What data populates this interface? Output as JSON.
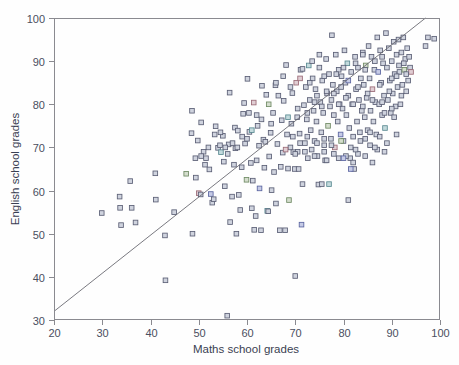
{
  "chart_data": {
    "type": "scatter",
    "title": "",
    "xlabel": "Maths school grades",
    "ylabel": "English school grades",
    "xlim": [
      20,
      100
    ],
    "ylim": [
      30,
      100
    ],
    "xticks": [
      20,
      30,
      40,
      50,
      60,
      70,
      80,
      90,
      100
    ],
    "yticks": [
      30,
      40,
      50,
      60,
      70,
      80,
      90,
      100
    ],
    "grid": false,
    "legend": null,
    "annotations": [
      {
        "type": "reference-line",
        "description": "diagonal identity line",
        "from": [
          20,
          32
        ],
        "to": [
          97,
          100
        ]
      }
    ],
    "marker": {
      "shape": "square",
      "size": 4.6,
      "edge_color": "#5b5f75",
      "face_color": "#cfd3de"
    },
    "points": [
      [
        29.9,
        54.8
      ],
      [
        33.6,
        58.6
      ],
      [
        33.7,
        56.0
      ],
      [
        33.9,
        52.0
      ],
      [
        35.8,
        62.2
      ],
      [
        36.1,
        56.0
      ],
      [
        36.9,
        52.6
      ],
      [
        41.0,
        64.0
      ],
      [
        41.1,
        57.9
      ],
      [
        43.0,
        49.6
      ],
      [
        43.1,
        39.2
      ],
      [
        44.9,
        55.0
      ],
      [
        47.4,
        63.9
      ],
      [
        48.6,
        78.5
      ],
      [
        48.5,
        73.3
      ],
      [
        48.7,
        50.0
      ],
      [
        49.4,
        63.0
      ],
      [
        49.8,
        71.6
      ],
      [
        49.3,
        67.5
      ],
      [
        50.0,
        59.4
      ],
      [
        50.4,
        59.1
      ],
      [
        50.5,
        75.8
      ],
      [
        51.3,
        66.0
      ],
      [
        51.5,
        67.5
      ],
      [
        52.2,
        64.9
      ],
      [
        52.5,
        59.2
      ],
      [
        52.8,
        57.2
      ],
      [
        53.3,
        73.0
      ],
      [
        53.1,
        58.0
      ],
      [
        53.5,
        74.9
      ],
      [
        54.0,
        69.9
      ],
      [
        54.4,
        70.5
      ],
      [
        54.6,
        68.9
      ],
      [
        55.0,
        72.7
      ],
      [
        55.2,
        66.7
      ],
      [
        55.4,
        61.0
      ],
      [
        55.9,
        31.0
      ],
      [
        56.2,
        70.7
      ],
      [
        56.4,
        82.7
      ],
      [
        56.5,
        52.7
      ],
      [
        56.9,
        58.6
      ],
      [
        57.3,
        66.0
      ],
      [
        57.5,
        74.6
      ],
      [
        57.6,
        69.8
      ],
      [
        57.8,
        50.0
      ],
      [
        58.1,
        73.9
      ],
      [
        58.3,
        59.0
      ],
      [
        58.6,
        55.5
      ],
      [
        58.9,
        65.4
      ],
      [
        59.2,
        77.8
      ],
      [
        59.4,
        80.3
      ],
      [
        59.6,
        70.9
      ],
      [
        59.9,
        62.5
      ],
      [
        60.1,
        85.9
      ],
      [
        60.4,
        78.0
      ],
      [
        60.5,
        73.6
      ],
      [
        60.8,
        66.4
      ],
      [
        61.0,
        55.9
      ],
      [
        61.2,
        62.3
      ],
      [
        61.4,
        80.4
      ],
      [
        61.5,
        50.9
      ],
      [
        61.8,
        54.1
      ],
      [
        62.0,
        67.0
      ],
      [
        62.2,
        75.0
      ],
      [
        62.5,
        70.4
      ],
      [
        62.6,
        60.5
      ],
      [
        62.9,
        50.8
      ],
      [
        63.1,
        84.3
      ],
      [
        63.4,
        71.8
      ],
      [
        63.6,
        65.3
      ],
      [
        63.8,
        71.3
      ],
      [
        64.0,
        82.2
      ],
      [
        64.2,
        55.3
      ],
      [
        64.4,
        55.2
      ],
      [
        64.6,
        67.9
      ],
      [
        64.9,
        73.4
      ],
      [
        65.1,
        60.1
      ],
      [
        65.4,
        78.0
      ],
      [
        65.6,
        64.3
      ],
      [
        65.9,
        84.4
      ],
      [
        66.0,
        57.0
      ],
      [
        66.3,
        70.8
      ],
      [
        66.5,
        82.0
      ],
      [
        66.8,
        50.8
      ],
      [
        67.0,
        65.5
      ],
      [
        67.2,
        76.3
      ],
      [
        67.4,
        68.8
      ],
      [
        67.6,
        80.8
      ],
      [
        67.9,
        50.8
      ],
      [
        68.1,
        89.1
      ],
      [
        68.3,
        73.0
      ],
      [
        68.5,
        65.1
      ],
      [
        68.7,
        57.8
      ],
      [
        69.0,
        70.0
      ],
      [
        69.2,
        75.5
      ],
      [
        69.4,
        82.6
      ],
      [
        69.6,
        68.9
      ],
      [
        69.9,
        65.0
      ],
      [
        70.0,
        40.2
      ],
      [
        70.2,
        85.0
      ],
      [
        70.4,
        77.0
      ],
      [
        70.5,
        69.0
      ],
      [
        70.7,
        65.0
      ],
      [
        70.9,
        73.2
      ],
      [
        71.1,
        88.0
      ],
      [
        71.3,
        52.1
      ],
      [
        71.5,
        61.5
      ],
      [
        71.8,
        79.8
      ],
      [
        72.0,
        71.0
      ],
      [
        72.2,
        84.0
      ],
      [
        72.4,
        76.5
      ],
      [
        72.6,
        67.5
      ],
      [
        72.8,
        89.0
      ],
      [
        73.0,
        81.0
      ],
      [
        73.2,
        74.0
      ],
      [
        73.4,
        69.5
      ],
      [
        73.6,
        86.0
      ],
      [
        73.8,
        78.5
      ],
      [
        74.0,
        71.5
      ],
      [
        74.2,
        83.5
      ],
      [
        74.4,
        76.0
      ],
      [
        74.6,
        68.0
      ],
      [
        74.8,
        61.4
      ],
      [
        75.0,
        88.5
      ],
      [
        75.2,
        80.5
      ],
      [
        75.4,
        73.5
      ],
      [
        75.6,
        85.5
      ],
      [
        75.8,
        78.0
      ],
      [
        76.0,
        70.5
      ],
      [
        76.2,
        67.0
      ],
      [
        76.4,
        90.5
      ],
      [
        76.6,
        82.5
      ],
      [
        76.8,
        75.0
      ],
      [
        77.0,
        87.0
      ],
      [
        77.2,
        79.5
      ],
      [
        77.4,
        72.0
      ],
      [
        77.6,
        96.0
      ],
      [
        77.8,
        84.5
      ],
      [
        78.0,
        77.5
      ],
      [
        78.2,
        70.0
      ],
      [
        78.4,
        91.5
      ],
      [
        78.6,
        83.0
      ],
      [
        78.8,
        76.0
      ],
      [
        79.0,
        88.0
      ],
      [
        79.2,
        80.0
      ],
      [
        79.4,
        73.0
      ],
      [
        79.6,
        86.5
      ],
      [
        79.8,
        79.0
      ],
      [
        80.0,
        71.5
      ],
      [
        80.2,
        92.5
      ],
      [
        80.4,
        85.0
      ],
      [
        80.6,
        77.5
      ],
      [
        80.8,
        89.5
      ],
      [
        81.0,
        82.0
      ],
      [
        81.2,
        74.5
      ],
      [
        81.4,
        67.5
      ],
      [
        81.0,
        57.8
      ],
      [
        81.6,
        87.5
      ],
      [
        81.8,
        80.0
      ],
      [
        82.0,
        72.5
      ],
      [
        82.2,
        65.0
      ],
      [
        82.4,
        91.0
      ],
      [
        82.6,
        83.5
      ],
      [
        82.8,
        76.0
      ],
      [
        83.0,
        88.5
      ],
      [
        83.2,
        81.0
      ],
      [
        83.4,
        73.5
      ],
      [
        83.6,
        86.0
      ],
      [
        83.8,
        78.5
      ],
      [
        84.0,
        92.0
      ],
      [
        84.2,
        84.5
      ],
      [
        84.4,
        77.0
      ],
      [
        84.6,
        89.0
      ],
      [
        84.8,
        81.5
      ],
      [
        85.0,
        74.0
      ],
      [
        85.2,
        93.5
      ],
      [
        85.4,
        86.0
      ],
      [
        85.6,
        78.5
      ],
      [
        85.8,
        91.0
      ],
      [
        86.0,
        83.5
      ],
      [
        86.2,
        76.0
      ],
      [
        86.4,
        88.0
      ],
      [
        86.6,
        80.5
      ],
      [
        86.8,
        73.0
      ],
      [
        87.0,
        95.5
      ],
      [
        87.2,
        87.5
      ],
      [
        87.4,
        80.0
      ],
      [
        87.6,
        92.5
      ],
      [
        87.8,
        85.0
      ],
      [
        88.0,
        77.5
      ],
      [
        88.2,
        89.5
      ],
      [
        88.4,
        82.0
      ],
      [
        88.6,
        74.5
      ],
      [
        88.8,
        96.5
      ],
      [
        89.0,
        88.5
      ],
      [
        89.2,
        81.0
      ],
      [
        89.4,
        93.0
      ],
      [
        89.6,
        85.5
      ],
      [
        89.8,
        78.0
      ],
      [
        90.0,
        90.0
      ],
      [
        90.2,
        82.5
      ],
      [
        90.4,
        94.5
      ],
      [
        90.6,
        87.0
      ],
      [
        90.8,
        79.5
      ],
      [
        91.0,
        91.5
      ],
      [
        91.2,
        84.0
      ],
      [
        91.4,
        95.0
      ],
      [
        91.6,
        87.5
      ],
      [
        91.8,
        80.0
      ],
      [
        92.0,
        92.0
      ],
      [
        92.2,
        84.5
      ],
      [
        92.4,
        95.5
      ],
      [
        92.6,
        88.0
      ],
      [
        92.8,
        90.5
      ],
      [
        93.0,
        83.0
      ],
      [
        93.2,
        93.0
      ],
      [
        93.4,
        85.5
      ],
      [
        93.6,
        91.0
      ],
      [
        93.8,
        88.5
      ],
      [
        94.0,
        87.5
      ],
      [
        97.5,
        95.5
      ],
      [
        98.8,
        95.2
      ],
      [
        97.0,
        93.5
      ],
      [
        84.0,
        91.5
      ],
      [
        86.0,
        66.5
      ],
      [
        81.5,
        65.0
      ],
      [
        80.5,
        68.0
      ],
      [
        79.0,
        67.5
      ],
      [
        76.5,
        67.0
      ],
      [
        75.5,
        61.5
      ],
      [
        84.5,
        72.0
      ],
      [
        82.0,
        66.5
      ],
      [
        77.0,
        61.5
      ],
      [
        88.5,
        78.0
      ],
      [
        90.5,
        77.0
      ],
      [
        85.5,
        73.5
      ],
      [
        87.0,
        69.5
      ],
      [
        83.0,
        68.5
      ],
      [
        71.5,
        88.2
      ],
      [
        73.5,
        90.0
      ],
      [
        75.0,
        91.5
      ],
      [
        76.0,
        86.5
      ],
      [
        78.5,
        87.0
      ],
      [
        80.0,
        88.5
      ],
      [
        82.5,
        89.5
      ],
      [
        84.5,
        88.0
      ],
      [
        86.5,
        90.0
      ],
      [
        88.0,
        91.0
      ],
      [
        90.0,
        86.0
      ],
      [
        91.5,
        89.0
      ],
      [
        93.0,
        87.0
      ],
      [
        66.0,
        85.0
      ],
      [
        64.5,
        80.0
      ],
      [
        62.0,
        77.5
      ],
      [
        60.0,
        72.0
      ],
      [
        58.0,
        70.0
      ],
      [
        56.0,
        68.5
      ],
      [
        67.5,
        86.5
      ],
      [
        69.0,
        84.0
      ],
      [
        71.0,
        86.0
      ],
      [
        73.0,
        85.0
      ],
      [
        74.5,
        82.0
      ],
      [
        76.5,
        83.0
      ],
      [
        78.0,
        82.5
      ],
      [
        79.5,
        84.0
      ],
      [
        81.0,
        85.5
      ],
      [
        83.0,
        84.0
      ],
      [
        85.0,
        82.5
      ],
      [
        87.5,
        84.5
      ],
      [
        89.5,
        83.0
      ],
      [
        91.0,
        86.5
      ],
      [
        92.5,
        89.5
      ],
      [
        68.5,
        77.0
      ],
      [
        70.5,
        79.0
      ],
      [
        72.5,
        78.0
      ],
      [
        74.0,
        80.5
      ],
      [
        75.5,
        79.5
      ],
      [
        77.5,
        81.0
      ],
      [
        79.0,
        80.0
      ],
      [
        80.5,
        81.5
      ],
      [
        82.0,
        80.0
      ],
      [
        84.0,
        79.5
      ],
      [
        86.0,
        81.0
      ],
      [
        88.0,
        80.5
      ],
      [
        90.0,
        79.0
      ],
      [
        92.0,
        82.0
      ],
      [
        69.5,
        72.5
      ],
      [
        71.0,
        71.0
      ],
      [
        72.5,
        72.5
      ],
      [
        74.5,
        71.0
      ],
      [
        76.0,
        72.0
      ],
      [
        77.5,
        70.5
      ],
      [
        79.5,
        71.5
      ],
      [
        81.5,
        70.0
      ],
      [
        83.5,
        71.5
      ],
      [
        85.5,
        70.5
      ],
      [
        87.5,
        72.5
      ],
      [
        89.0,
        71.0
      ],
      [
        91.0,
        73.0
      ],
      [
        68.0,
        69.5
      ],
      [
        70.0,
        68.5
      ],
      [
        72.0,
        69.0
      ],
      [
        74.0,
        68.0
      ],
      [
        76.0,
        69.0
      ],
      [
        78.0,
        68.5
      ],
      [
        80.0,
        67.5
      ],
      [
        82.5,
        69.5
      ],
      [
        84.5,
        68.0
      ],
      [
        86.5,
        70.0
      ],
      [
        88.5,
        69.0
      ],
      [
        65.0,
        75.5
      ],
      [
        63.0,
        76.5
      ],
      [
        61.0,
        74.0
      ],
      [
        59.0,
        72.5
      ],
      [
        57.0,
        71.0
      ],
      [
        55.5,
        70.0
      ],
      [
        54.5,
        73.5
      ],
      [
        52.0,
        70.0
      ],
      [
        51.0,
        69.0
      ],
      [
        50.5,
        68.0
      ]
    ]
  },
  "axes": {
    "x_tick_labels": [
      "20",
      "30",
      "40",
      "50",
      "60",
      "70",
      "80",
      "90",
      "100"
    ],
    "y_tick_labels": [
      "30",
      "40",
      "50",
      "60",
      "70",
      "80",
      "90",
      "100"
    ]
  },
  "colors": {
    "frame": "#8a8a90",
    "tick_text": "#4a4f60",
    "axis_title": "#3a3f52",
    "reference_line": "#6a6a72",
    "marker_edge": "#5b5f75",
    "marker_face": "#cfd3de",
    "background": "#ffffff"
  }
}
